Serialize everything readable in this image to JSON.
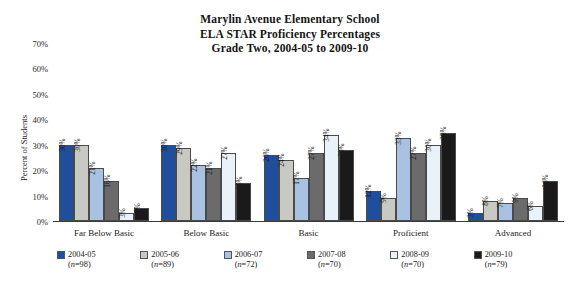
{
  "title": {
    "line1": "Marylin Avenue Elementary School",
    "line2": "ELA STAR Proficiency Percentages",
    "line3": "Grade Two, 2004-05 to 2009-10"
  },
  "axis": {
    "ylabel": "Percent of Students",
    "yticks": [
      "0%",
      "10%",
      "20%",
      "30%",
      "40%",
      "50%",
      "60%",
      "70%"
    ]
  },
  "legend": [
    {
      "label": "2004-05",
      "n": "(n=98)",
      "color": "#1F4E9C"
    },
    {
      "label": "2005-06",
      "n": "(n=89)",
      "color": "#C9C9C3"
    },
    {
      "label": "2006-07",
      "n": "(n=72)",
      "color": "#A9C2E2"
    },
    {
      "label": "2007-08",
      "n": "(n=70)",
      "color": "#6B6B6B"
    },
    {
      "label": "2008-09",
      "n": "(n=70)",
      "color": "#E9F1F9"
    },
    {
      "label": "2009-10",
      "n": "(n=79)",
      "color": "#1A1A1A"
    }
  ],
  "chart_data": {
    "type": "bar",
    "title": "Marylin Avenue Elementary School ELA STAR Proficiency Percentages Grade Two, 2004-05 to 2009-10",
    "xlabel": "",
    "ylabel": "Percent of Students",
    "ylim": [
      0,
      70
    ],
    "ytick_step": 10,
    "grid": false,
    "legend_position": "bottom",
    "data_labels": true,
    "categories": [
      "Far Below Basic",
      "Below Basic",
      "Basic",
      "Proficient",
      "Advanced"
    ],
    "series": [
      {
        "name": "2004-05",
        "n": 98,
        "color": "#1F4E9C",
        "values": [
          30,
          30,
          26,
          12,
          3
        ],
        "labels": [
          "30%",
          "30%",
          "26%",
          "12%",
          "3%"
        ]
      },
      {
        "name": "2005-06",
        "n": 89,
        "color": "#C9C9C3",
        "values": [
          30,
          29,
          24,
          9,
          8
        ],
        "labels": [
          "30%",
          "29%",
          "24%",
          "9%",
          "8%"
        ]
      },
      {
        "name": "2006-07",
        "n": 72,
        "color": "#A9C2E2",
        "values": [
          21,
          22,
          17,
          33,
          7
        ],
        "labels": [
          "21%",
          "22%",
          "17%",
          "33%",
          "7%"
        ]
      },
      {
        "name": "2007-08",
        "n": 70,
        "color": "#6B6B6B",
        "values": [
          16,
          21,
          27,
          27,
          9
        ],
        "labels": [
          "16%",
          "21%",
          "27%",
          "27%",
          "9%"
        ]
      },
      {
        "name": "2008-09",
        "n": 70,
        "color": "#E9F1F9",
        "values": [
          3,
          27,
          34,
          30,
          6
        ],
        "labels": [
          "3%",
          "27%",
          "34%",
          "30%",
          "6%"
        ]
      },
      {
        "name": "2009-10",
        "n": 79,
        "color": "#1A1A1A",
        "values": [
          5,
          15,
          28,
          35,
          16
        ],
        "labels": [
          "5%",
          "15%",
          "28%",
          "35%",
          "16%"
        ]
      }
    ]
  }
}
